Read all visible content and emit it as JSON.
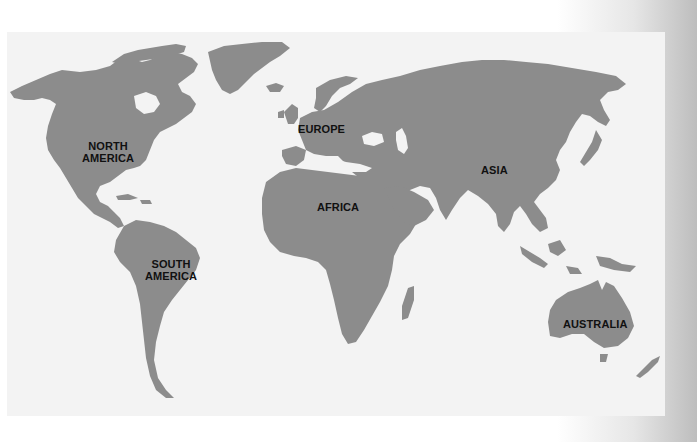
{
  "map": {
    "type": "world-continents",
    "colors": {
      "page_background": "#ffffff",
      "panel_background": "#f3f3f3",
      "land": "#8c8c8c",
      "label_text": "#111111"
    },
    "labels": {
      "north_america_line1": "NORTH",
      "north_america_line2": "AMERICA",
      "south_america_line1": "SOUTH",
      "south_america_line2": "AMERICA",
      "europe": "EUROPE",
      "africa": "AFRICA",
      "asia": "ASIA",
      "australia": "AUSTRALIA"
    }
  }
}
